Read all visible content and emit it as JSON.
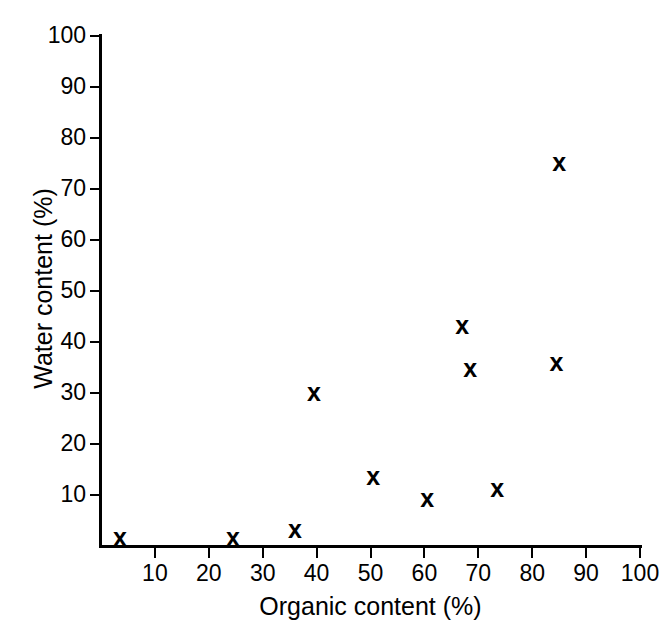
{
  "chart_data": {
    "type": "scatter",
    "title": "",
    "xlabel": "Organic content (%)",
    "ylabel": "Water content (%)",
    "xlim": [
      0,
      100
    ],
    "ylim": [
      0,
      100
    ],
    "xticks": [
      10,
      20,
      30,
      40,
      50,
      60,
      70,
      80,
      90,
      100
    ],
    "yticks": [
      10,
      20,
      30,
      40,
      50,
      60,
      70,
      80,
      90,
      100
    ],
    "xtick_labels": [
      "10",
      "20",
      "30",
      "40",
      "50",
      "60",
      "70",
      "80",
      "90",
      "100"
    ],
    "ytick_labels": [
      "10",
      "20",
      "30",
      "40",
      "50",
      "60",
      "70",
      "80",
      "90",
      "100"
    ],
    "grid": false,
    "legend": null,
    "marker": "x",
    "marker_color": "#000000",
    "points": [
      {
        "x": 3.5,
        "y": 1.8
      },
      {
        "x": 24.5,
        "y": 1.8
      },
      {
        "x": 36.0,
        "y": 3.3
      },
      {
        "x": 39.5,
        "y": 30.2
      },
      {
        "x": 50.5,
        "y": 13.8
      },
      {
        "x": 60.5,
        "y": 9.5
      },
      {
        "x": 67.0,
        "y": 43.3
      },
      {
        "x": 68.5,
        "y": 35.0
      },
      {
        "x": 73.5,
        "y": 11.3
      },
      {
        "x": 84.5,
        "y": 36.0
      },
      {
        "x": 85.0,
        "y": 75.3
      }
    ]
  }
}
